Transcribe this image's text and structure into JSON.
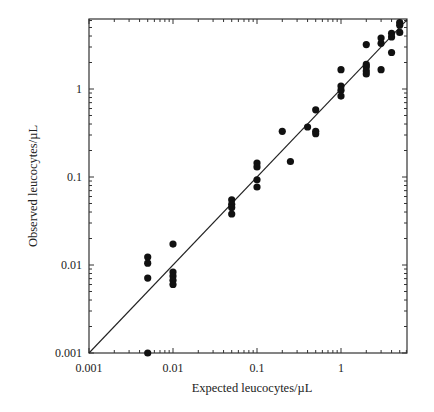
{
  "chart_data": {
    "type": "scatter",
    "title": "",
    "xlabel": "Expected leucocytes/µL",
    "ylabel": "Observed leucocytes/µL",
    "xscale": "log",
    "yscale": "log",
    "xlim": [
      0.001,
      6.1
    ],
    "ylim": [
      0.001,
      6.3
    ],
    "xticks": [
      0.001,
      0.01,
      0.1,
      1
    ],
    "yticks": [
      0.001,
      0.01,
      0.1,
      1
    ],
    "xtick_labels": [
      "0.001",
      "0.01",
      "0.1",
      "1"
    ],
    "ytick_labels": [
      "0.001",
      "0.01",
      "0.1",
      "1"
    ],
    "grid": false,
    "legend": null,
    "reference_line": {
      "label": "y = x",
      "from": [
        0.001,
        0.001
      ],
      "to": [
        6.1,
        6.1
      ]
    },
    "series": [
      {
        "name": "Observed vs expected",
        "marker": "filled-circle",
        "points": [
          [
            0.005,
            0.001
          ],
          [
            0.005,
            0.0123
          ],
          [
            0.005,
            0.0105
          ],
          [
            0.005,
            0.0071
          ],
          [
            0.01,
            0.0173
          ],
          [
            0.01,
            0.0083
          ],
          [
            0.01,
            0.0075
          ],
          [
            0.01,
            0.0067
          ],
          [
            0.01,
            0.006
          ],
          [
            0.05,
            0.055
          ],
          [
            0.05,
            0.049
          ],
          [
            0.05,
            0.045
          ],
          [
            0.05,
            0.038
          ],
          [
            0.1,
            0.144
          ],
          [
            0.1,
            0.13
          ],
          [
            0.1,
            0.093
          ],
          [
            0.1,
            0.077
          ],
          [
            0.2,
            0.33
          ],
          [
            0.25,
            0.15
          ],
          [
            0.4,
            0.37
          ],
          [
            0.5,
            0.58
          ],
          [
            0.5,
            0.33
          ],
          [
            0.5,
            0.31
          ],
          [
            1.0,
            1.66
          ],
          [
            1.0,
            1.08
          ],
          [
            1.0,
            0.97
          ],
          [
            1.0,
            0.83
          ],
          [
            2.0,
            3.2
          ],
          [
            2.0,
            1.9
          ],
          [
            2.0,
            1.78
          ],
          [
            2.0,
            1.6
          ],
          [
            2.0,
            1.48
          ],
          [
            3.0,
            3.8
          ],
          [
            3.0,
            3.3
          ],
          [
            3.0,
            1.66
          ],
          [
            4.0,
            4.3
          ],
          [
            4.0,
            3.9
          ],
          [
            4.0,
            2.6
          ],
          [
            5.0,
            5.7
          ],
          [
            5.0,
            5.3
          ],
          [
            5.0,
            4.4
          ]
        ]
      }
    ]
  }
}
